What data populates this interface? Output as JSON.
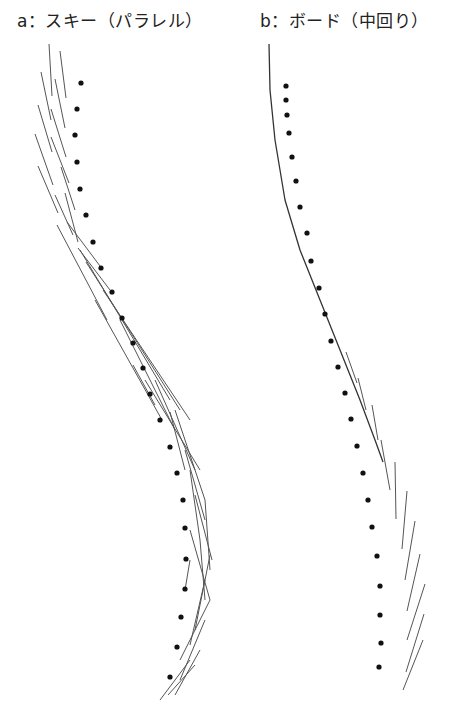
{
  "panels": [
    {
      "id": "a",
      "title": "a：スキー（パラレル）",
      "track_dots": [
        [
          81,
          83
        ],
        [
          77,
          109
        ],
        [
          75,
          135
        ],
        [
          77,
          162
        ],
        [
          80,
          189
        ],
        [
          86,
          215
        ],
        [
          93,
          242
        ],
        [
          101,
          268
        ],
        [
          112,
          292
        ],
        [
          122,
          318
        ],
        [
          133,
          343
        ],
        [
          143,
          368
        ],
        [
          150,
          394
        ],
        [
          160,
          420
        ],
        [
          170,
          447
        ],
        [
          177,
          473
        ],
        [
          183,
          500
        ],
        [
          185,
          528
        ],
        [
          186,
          559
        ],
        [
          185,
          589
        ],
        [
          181,
          617
        ],
        [
          177,
          647
        ],
        [
          170,
          677
        ]
      ],
      "ski_tracks": [
        [
          [
            49,
            44
          ],
          [
            52,
            96
          ]
        ],
        [
          [
            60,
            51
          ],
          [
            66,
            98
          ]
        ],
        [
          [
            41,
            72
          ],
          [
            51,
            120
          ]
        ],
        [
          [
            55,
            79
          ],
          [
            65,
            128
          ]
        ],
        [
          [
            38,
            105
          ],
          [
            52,
            152
          ]
        ],
        [
          [
            51,
            109
          ],
          [
            66,
            157
          ]
        ],
        [
          [
            35,
            134
          ],
          [
            53,
            185
          ]
        ],
        [
          [
            51,
            137
          ],
          [
            69,
            183
          ]
        ],
        [
          [
            38,
            166
          ],
          [
            58,
            213
          ]
        ],
        [
          [
            61,
            167
          ],
          [
            75,
            210
          ]
        ],
        [
          [
            55,
            195
          ],
          [
            73,
            235
          ]
        ],
        [
          [
            65,
            193
          ],
          [
            78,
            242
          ]
        ],
        [
          [
            57,
            225
          ],
          [
            107,
            320
          ]
        ],
        [
          [
            67,
            222
          ],
          [
            100,
            266
          ]
        ],
        [
          [
            78,
            248
          ],
          [
            110,
            290
          ]
        ],
        [
          [
            80,
            250
          ],
          [
            170,
            400
          ]
        ],
        [
          [
            86,
            262
          ],
          [
            180,
            410
          ]
        ],
        [
          [
            95,
            300
          ],
          [
            162,
            420
          ]
        ],
        [
          [
            103,
            290
          ],
          [
            190,
            420
          ]
        ],
        [
          [
            120,
            320
          ],
          [
            175,
            430
          ]
        ],
        [
          [
            133,
            365
          ],
          [
            155,
            405
          ]
        ],
        [
          [
            145,
            380
          ],
          [
            200,
            470
          ]
        ],
        [
          [
            155,
            380
          ],
          [
            195,
            470
          ]
        ],
        [
          [
            170,
            412
          ],
          [
            185,
            470
          ]
        ],
        [
          [
            175,
            410
          ],
          [
            205,
            500
          ]
        ],
        [
          [
            185,
            450
          ],
          [
            205,
            520
          ]
        ],
        [
          [
            190,
            470
          ],
          [
            200,
            540
          ]
        ],
        [
          [
            195,
            495
          ],
          [
            212,
            560
          ]
        ],
        [
          [
            205,
            500
          ],
          [
            210,
            570
          ]
        ],
        [
          [
            190,
            530
          ],
          [
            210,
            600
          ]
        ],
        [
          [
            200,
            540
          ],
          [
            205,
            600
          ]
        ],
        [
          [
            210,
            555
          ],
          [
            195,
            630
          ]
        ],
        [
          [
            205,
            580
          ],
          [
            190,
            645
          ]
        ],
        [
          [
            210,
            600
          ],
          [
            180,
            660
          ]
        ],
        [
          [
            205,
            620
          ],
          [
            180,
            680
          ]
        ],
        [
          [
            200,
            650
          ],
          [
            175,
            695
          ]
        ],
        [
          [
            190,
            660
          ],
          [
            160,
            700
          ]
        ],
        [
          [
            195,
            665
          ],
          [
            168,
            695
          ]
        ],
        [
          [
            185,
            590
          ],
          [
            190,
            560
          ]
        ]
      ]
    },
    {
      "id": "b",
      "title": "b：ボード（中回り）",
      "track_dots": [
        [
          286,
          86
        ],
        [
          286,
          100
        ],
        [
          287,
          115
        ],
        [
          289,
          133
        ],
        [
          292,
          157
        ],
        [
          296,
          181
        ],
        [
          300,
          207
        ],
        [
          307,
          233
        ],
        [
          311,
          261
        ],
        [
          319,
          288
        ],
        [
          325,
          314
        ],
        [
          331,
          341
        ],
        [
          338,
          367
        ],
        [
          345,
          393
        ],
        [
          351,
          419
        ],
        [
          357,
          446
        ],
        [
          363,
          473
        ],
        [
          368,
          500
        ],
        [
          372,
          527
        ],
        [
          377,
          556
        ],
        [
          380,
          586
        ],
        [
          380,
          615
        ],
        [
          381,
          643
        ],
        [
          379,
          667
        ]
      ],
      "board_curve": [
        [
          269,
          44
        ],
        [
          270,
          90
        ],
        [
          275,
          140
        ],
        [
          285,
          200
        ],
        [
          300,
          250
        ],
        [
          320,
          300
        ],
        [
          340,
          350
        ],
        [
          360,
          400
        ],
        [
          375,
          440
        ],
        [
          383,
          462
        ]
      ],
      "board_tracks": [
        [
          [
            346,
            352
          ],
          [
            357,
            383
          ]
        ],
        [
          [
            358,
            378
          ],
          [
            366,
            410
          ]
        ],
        [
          [
            372,
            405
          ],
          [
            378,
            440
          ]
        ],
        [
          [
            381,
            440
          ],
          [
            390,
            490
          ]
        ],
        [
          [
            395,
            462
          ],
          [
            396,
            519
          ]
        ],
        [
          [
            407,
            491
          ],
          [
            402,
            549
          ]
        ],
        [
          [
            415,
            521
          ],
          [
            405,
            580
          ]
        ],
        [
          [
            420,
            554
          ],
          [
            407,
            611
          ]
        ],
        [
          [
            425,
            584
          ],
          [
            407,
            640
          ]
        ],
        [
          [
            424,
            614
          ],
          [
            406,
            672
          ]
        ],
        [
          [
            423,
            640
          ],
          [
            403,
            690
          ]
        ]
      ]
    }
  ],
  "colors": {
    "dot": "#111111",
    "line": "#555555",
    "text": "#222222"
  }
}
